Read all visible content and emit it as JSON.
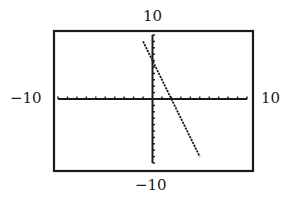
{
  "chart_data": {
    "type": "line",
    "title": "",
    "xlabel": "",
    "ylabel": "",
    "xlim": [
      -10,
      10
    ],
    "ylim": [
      -10,
      10
    ],
    "window_labels": {
      "ymax": "10",
      "ymin": "−10",
      "xmin": "−10",
      "xmax": "10"
    },
    "xscale": 1,
    "yscale": 1,
    "grid": false,
    "legend": null,
    "series": [
      {
        "name": "line",
        "equation": "y = -3x + 6",
        "slope": -3,
        "intercept": 6,
        "x": [
          -1,
          0,
          2,
          5
        ],
        "y": [
          9,
          6,
          0,
          -9
        ]
      }
    ],
    "x_intercept": 2,
    "y_intercept": 6
  },
  "colors": {
    "ink": "#1a1a1a",
    "background": "#ffffff"
  }
}
